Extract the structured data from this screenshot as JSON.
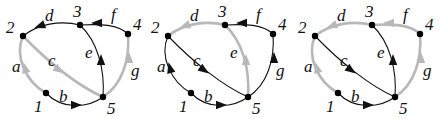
{
  "diagram": {
    "type": "directed-graph-triptych",
    "colors": {
      "normal_edge": "#111111",
      "highlight_edge": "#b8b8b8",
      "node": "#000000",
      "text": "#111111"
    },
    "nodes": [
      {
        "id": "1",
        "label": "1",
        "x": 46,
        "y": 93,
        "lx": 34,
        "ly": 112
      },
      {
        "id": "2",
        "label": "2",
        "x": 23,
        "y": 36,
        "lx": 6,
        "ly": 33
      },
      {
        "id": "3",
        "label": "3",
        "x": 80,
        "y": 25,
        "lx": 73,
        "ly": 17
      },
      {
        "id": "4",
        "label": "4",
        "x": 128,
        "y": 34,
        "lx": 133,
        "ly": 30
      },
      {
        "id": "5",
        "label": "5",
        "x": 103,
        "y": 97,
        "lx": 107,
        "ly": 114
      }
    ],
    "edges": [
      {
        "id": "a",
        "label": "a",
        "from": "1",
        "to": "2",
        "path": "M46,93 C26,82 14,56 23,36",
        "lx": 12,
        "ly": 72,
        "ax": 25,
        "ay": 68,
        "angle": -105
      },
      {
        "id": "b",
        "label": "b",
        "from": "1",
        "to": "5",
        "path": "M46,93 C62,110 88,108 103,97",
        "lx": 59,
        "ly": 102,
        "ax": 76,
        "ay": 105,
        "angle": 0
      },
      {
        "id": "c",
        "label": "c",
        "from": "2",
        "to": "5",
        "path": "M23,36 C48,62 78,86 103,97",
        "lx": 48,
        "ly": 66,
        "ax": 59,
        "ay": 70,
        "angle": 35
      },
      {
        "id": "d",
        "label": "d",
        "from": "3",
        "to": "2",
        "path": "M80,25 C60,20 38,24 23,36",
        "lx": 45,
        "ly": 21,
        "ax": 40,
        "ay": 26,
        "angle": 160
      },
      {
        "id": "e",
        "label": "e",
        "from": "5",
        "to": "3",
        "path": "M103,97 C105,70 98,42 80,25",
        "lx": 85,
        "ly": 58,
        "ax": 101,
        "ay": 60,
        "angle": -90
      },
      {
        "id": "f",
        "label": "f",
        "from": "4",
        "to": "3",
        "path": "M128,34 C118,24 100,24 80,25",
        "lx": 111,
        "ly": 20,
        "ax": 97,
        "ay": 23,
        "angle": 180
      },
      {
        "id": "g",
        "label": "g",
        "from": "5",
        "to": "4",
        "path": "M103,97 C122,85 130,60 128,34",
        "lx": 131,
        "ly": 76,
        "ax": 129,
        "ay": 58,
        "angle": -90
      }
    ],
    "panels": [
      {
        "name": "panel-1",
        "offset_x": 0,
        "highlighted": [
          "a",
          "c",
          "g"
        ]
      },
      {
        "name": "panel-2",
        "offset_x": 145,
        "highlighted": [
          "d",
          "e"
        ]
      },
      {
        "name": "panel-3",
        "offset_x": 292,
        "highlighted": [
          "a",
          "d",
          "f",
          "g"
        ]
      }
    ]
  }
}
